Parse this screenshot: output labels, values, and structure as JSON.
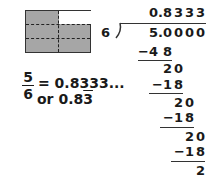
{
  "model": {
    "description": "Rectangle divided into 6 equal parts (2 columns x 3 rows), 5 shaded",
    "columns": 2,
    "rows": 3,
    "shaded_parts": 5,
    "total_parts": 6,
    "colors": {
      "shaded": "#a6a6a6",
      "unshaded": "#ffffff",
      "border": "#333333"
    }
  },
  "equation": {
    "numerator": "5",
    "denominator": "6",
    "equals": "= 0.8333...",
    "alt_prefix": "or 0.8",
    "alt_repeating": "3"
  },
  "long_division": {
    "divisor": "6",
    "dividend": [
      "5",
      ".",
      "0",
      "0",
      "0",
      "0"
    ],
    "quotient": [
      "0",
      ".",
      "8",
      "3",
      "3",
      "3"
    ],
    "steps": [
      {
        "sub": "−48",
        "digits": [
          "−4",
          "8"
        ],
        "cols": [
          0,
          2
        ]
      },
      {
        "rem": "20",
        "digits": [
          "2",
          "0"
        ],
        "cols": [
          2,
          3
        ]
      },
      {
        "sub": "−18",
        "digits": [
          "−1",
          "8"
        ],
        "cols": [
          2,
          3
        ]
      },
      {
        "rem": "20",
        "digits": [
          "2",
          "0"
        ],
        "cols": [
          3,
          4
        ]
      },
      {
        "sub": "−18",
        "digits": [
          "−1",
          "8"
        ],
        "cols": [
          3,
          4
        ]
      },
      {
        "rem": "20",
        "digits": [
          "2",
          "0"
        ],
        "cols": [
          4,
          5
        ]
      },
      {
        "sub": "−18",
        "digits": [
          "−1",
          "8"
        ],
        "cols": [
          4,
          5
        ]
      },
      {
        "rem": "2",
        "digits": [
          "2"
        ],
        "cols": [
          5
        ]
      }
    ]
  }
}
